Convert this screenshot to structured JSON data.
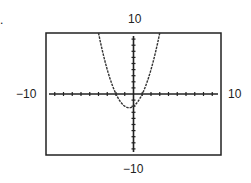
{
  "chart_data": {
    "type": "line",
    "title": "",
    "xlabel": "",
    "ylabel": "",
    "xlim": [
      -10,
      10
    ],
    "ylim": [
      -10,
      10
    ],
    "tick_spacing": 1,
    "grid": false,
    "series": [
      {
        "name": "y = x^2 + x - 2",
        "x": [
          -4,
          -3,
          -2,
          -1,
          -0.5,
          0,
          1,
          2,
          3
        ],
        "y": [
          10,
          4,
          0,
          -2,
          -2.25,
          -2,
          0,
          4,
          10
        ]
      }
    ],
    "window_labels": {
      "top": "10",
      "bottom": "-10",
      "left": "-10",
      "right": "10"
    }
  },
  "labels": {
    "top": "10",
    "bottom": "−10",
    "left": "−10",
    "right": "10"
  },
  "corner_mark": "."
}
